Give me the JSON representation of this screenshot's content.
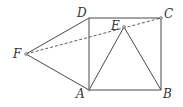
{
  "diagram": {
    "type": "geometry",
    "points": {
      "A": {
        "label": "A",
        "x": 89,
        "y": 90
      },
      "B": {
        "label": "B",
        "x": 161,
        "y": 90
      },
      "C": {
        "label": "C",
        "x": 161,
        "y": 18
      },
      "D": {
        "label": "D",
        "x": 89,
        "y": 18
      },
      "E": {
        "label": "E",
        "x": 124,
        "y": 27
      },
      "F": {
        "label": "F",
        "x": 26,
        "y": 54
      }
    },
    "segments": [
      {
        "from": "A",
        "to": "B",
        "style": "solid"
      },
      {
        "from": "B",
        "to": "C",
        "style": "solid"
      },
      {
        "from": "C",
        "to": "D",
        "style": "solid"
      },
      {
        "from": "D",
        "to": "A",
        "style": "solid"
      },
      {
        "from": "A",
        "to": "E",
        "style": "solid"
      },
      {
        "from": "B",
        "to": "E",
        "style": "solid"
      },
      {
        "from": "F",
        "to": "D",
        "style": "solid"
      },
      {
        "from": "F",
        "to": "A",
        "style": "solid"
      },
      {
        "from": "F",
        "to": "C",
        "style": "dashed"
      }
    ],
    "colors": {
      "line": "#4a4a4a",
      "label": "#333333",
      "background": "#ffffff"
    }
  }
}
